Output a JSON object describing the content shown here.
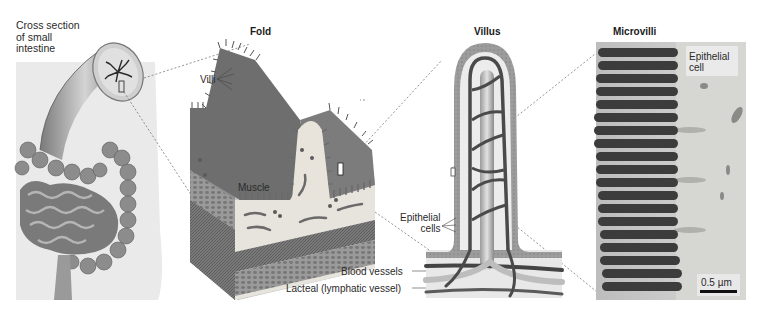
{
  "figure": {
    "panels": [
      {
        "id": "cross-section",
        "title": "Cross section\nof small\nintestine"
      },
      {
        "id": "fold",
        "title": "Fold"
      },
      {
        "id": "villus",
        "title": "Villus"
      },
      {
        "id": "microvilli",
        "title": "Microvilli"
      }
    ],
    "labels": {
      "villi": "Villi",
      "muscle": "Muscle",
      "epithelial_cells": "Epithelial\ncells",
      "blood_vessels": "Blood vessels",
      "lacteal": "Lacteal (lymphatic vessel)",
      "epithelial_cell": "Epithelial\ncell",
      "scale_bar": "0.5 µm"
    },
    "colors": {
      "tissue_gray": "#8a8a8a",
      "dark_vessel": "#4a4a4a",
      "light_bg": "#e6e6e6",
      "epithelium": "#9a9a9a"
    }
  }
}
